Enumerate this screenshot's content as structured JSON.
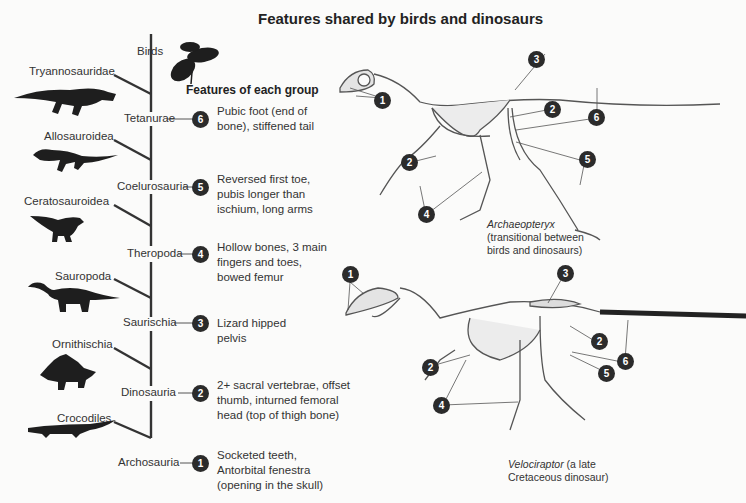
{
  "title": "Features shared by birds and dinosaurs",
  "features_heading": "Features of each group",
  "cladogram": {
    "taxa": [
      {
        "name": "Birds",
        "silhouette": "bird-silhouette-icon"
      },
      {
        "name": "Tryannosauridae",
        "silhouette": "tyrannosaur-silhouette-icon"
      },
      {
        "name": "Allosauroidea",
        "silhouette": "allosaur-silhouette-icon"
      },
      {
        "name": "Ceratosauroidea",
        "silhouette": "ceratosaur-silhouette-icon"
      },
      {
        "name": "Sauropoda",
        "silhouette": "sauropod-silhouette-icon"
      },
      {
        "name": "Ornithischia",
        "silhouette": "stegosaur-silhouette-icon"
      },
      {
        "name": "Crocodiles",
        "silhouette": "crocodile-silhouette-icon"
      }
    ],
    "nodes": [
      {
        "name": "Tetanurae",
        "number": "6",
        "feature": "Pubic foot (end of bone), stiffened tail"
      },
      {
        "name": "Coelurosauria",
        "number": "5",
        "feature": "Reversed first toe, pubis longer than ischium, long arms"
      },
      {
        "name": "Theropoda",
        "number": "4",
        "feature": "Hollow bones, 3 main fingers and toes, bowed femur"
      },
      {
        "name": "Saurischia",
        "number": "3",
        "feature": "Lizard hipped pelvis"
      },
      {
        "name": "Dinosauria",
        "number": "2",
        "feature": "2+ sacral vertebrae, offset thumb, inturned femoral head (top of thigh bone)"
      },
      {
        "name": "Archosauria",
        "number": "1",
        "feature": "Socketed teeth, Antorbital fenestra (opening in the skull)"
      }
    ]
  },
  "skeletons": [
    {
      "name": "Archaeopteryx",
      "caption_italic": "Archaeopteryx",
      "caption_rest": "(transitional between birds and dinosaurs)",
      "caption_line2": "(transitional between",
      "caption_line3": "birds and dinosaurs)",
      "markers": [
        "1",
        "2",
        "2",
        "3",
        "4",
        "5",
        "6"
      ]
    },
    {
      "name": "Velociraptor",
      "caption_italic": "Velociraptor",
      "caption_line1_rest": " (a late",
      "caption_line2": "Cretaceous dinosaur)",
      "markers": [
        "1",
        "2",
        "2",
        "3",
        "4",
        "5",
        "6"
      ]
    }
  ]
}
